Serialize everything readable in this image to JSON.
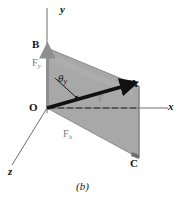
{
  "figure": {
    "caption": "(b)",
    "background_color": "#ffffff",
    "plane_fill_color": "#a8a8a8",
    "plane_edge_color": "#8e8e8e",
    "axis_color": "#6e6e6e",
    "vector_color": "#111111",
    "component_label_color": "#7c7c7c"
  },
  "axes": [
    {
      "name": "y-axis",
      "label": "y"
    },
    {
      "name": "x-axis",
      "label": "x"
    },
    {
      "name": "z-axis",
      "label": "z"
    }
  ],
  "points": [
    {
      "name": "origin",
      "label": "O"
    },
    {
      "name": "point-b",
      "label": "B"
    },
    {
      "name": "point-a",
      "label": "A"
    },
    {
      "name": "point-c",
      "label": "C"
    }
  ],
  "vectors": [
    {
      "name": "force-vector",
      "label": "F",
      "subscript": ""
    },
    {
      "name": "vertical-component",
      "label": "F",
      "subscript": "y"
    },
    {
      "name": "horizontal-component",
      "label": "F",
      "subscript": "h"
    }
  ],
  "angle": {
    "symbol": "θ",
    "subscript": "y",
    "full_label": "θy"
  },
  "labels": {
    "y_axis": "y",
    "x_axis": "x",
    "z_axis": "z",
    "origin": "O",
    "b": "B",
    "a": "A",
    "c": "C",
    "f_vector": "F",
    "f_y_base": "F",
    "f_y_sub": "y",
    "f_h_base": "F",
    "f_h_sub": "h",
    "theta_base": "θ",
    "theta_sub": "y",
    "caption": "(b)"
  }
}
